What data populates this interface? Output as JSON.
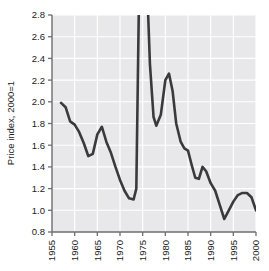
{
  "chart_data": {
    "type": "line",
    "title": "",
    "xlabel": "",
    "ylabel": "Price index, 2000=1",
    "xlim": [
      1955,
      2000
    ],
    "ylim": [
      0.8,
      2.8
    ],
    "xticks": [
      1955,
      1960,
      1965,
      1970,
      1975,
      1980,
      1985,
      1990,
      1995,
      2000
    ],
    "ytick_labels": [
      "0.8",
      "1.0",
      "1.2",
      "1.4",
      "1.6",
      "1.8",
      "2.0",
      "2.2",
      "2.4",
      "2.6",
      "2.8"
    ],
    "yticks": [
      0.8,
      1.0,
      1.2,
      1.4,
      1.6,
      1.8,
      2.0,
      2.2,
      2.4,
      2.6,
      2.8
    ],
    "grid": true,
    "grid_color": "#ffffff",
    "plot_background": "#e8e8ea",
    "line_color": "#3a3a3a",
    "line_width": 2.6,
    "clipped_note": "Series exceeds top of axis (2.8) during 1974 and 1976 spikes",
    "series": [
      {
        "name": "Price index",
        "x": [
          1957.0,
          1958.0,
          1959.0,
          1960.0,
          1961.0,
          1962.0,
          1963.0,
          1964.0,
          1965.0,
          1966.0,
          1967.0,
          1968.0,
          1969.0,
          1970.0,
          1971.0,
          1972.0,
          1973.0,
          1973.6,
          1974.2,
          1975.0,
          1975.4,
          1976.0,
          1976.6,
          1977.4,
          1978.0,
          1979.0,
          1980.0,
          1980.8,
          1981.6,
          1982.4,
          1983.4,
          1984.2,
          1985.0,
          1985.8,
          1986.6,
          1987.4,
          1988.2,
          1989.0,
          1990.0,
          1991.0,
          1992.0,
          1993.0,
          1994.0,
          1995.0,
          1996.0,
          1997.0,
          1998.0,
          1999.0,
          2000.0
        ],
        "y": [
          1.99,
          1.95,
          1.82,
          1.79,
          1.72,
          1.62,
          1.5,
          1.52,
          1.7,
          1.77,
          1.63,
          1.53,
          1.4,
          1.28,
          1.18,
          1.11,
          1.1,
          1.2,
          3.0,
          3.4,
          3.3,
          3.05,
          2.35,
          1.86,
          1.78,
          1.88,
          2.2,
          2.26,
          2.1,
          1.8,
          1.63,
          1.57,
          1.55,
          1.42,
          1.3,
          1.29,
          1.4,
          1.36,
          1.25,
          1.18,
          1.05,
          0.92,
          1.0,
          1.08,
          1.14,
          1.16,
          1.16,
          1.12,
          1.0
        ]
      }
    ]
  },
  "axis": {
    "y_title": "Price index, 2000=1",
    "y_labels": [
      "2.8",
      "2.6",
      "2.4",
      "2.2",
      "2.0",
      "1.8",
      "1.6",
      "1.4",
      "1.2",
      "1.0",
      "0.8"
    ],
    "x_labels": [
      "1955",
      "1960",
      "1965",
      "1970",
      "1975",
      "1980",
      "1985",
      "1990",
      "1995",
      "2000"
    ]
  }
}
